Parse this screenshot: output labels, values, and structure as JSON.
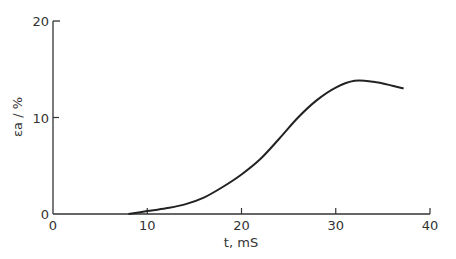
{
  "chart_data": {
    "type": "line",
    "title": "",
    "xlabel": "t, mS",
    "ylabel": "εa / %",
    "xlim": [
      0,
      40
    ],
    "ylim": [
      0,
      20
    ],
    "xticks": [
      0,
      10,
      20,
      30,
      40
    ],
    "yticks": [
      0,
      10,
      20
    ],
    "grid": false,
    "series": [
      {
        "name": "εa",
        "x": [
          8,
          10,
          12,
          14,
          16,
          18,
          20,
          22,
          24,
          26,
          28,
          30,
          32,
          34,
          36,
          37.2
        ],
        "values": [
          0,
          0.3,
          0.6,
          1.0,
          1.7,
          2.8,
          4.1,
          5.7,
          7.8,
          10.0,
          11.8,
          13.1,
          13.8,
          13.7,
          13.3,
          13.0
        ]
      }
    ]
  }
}
